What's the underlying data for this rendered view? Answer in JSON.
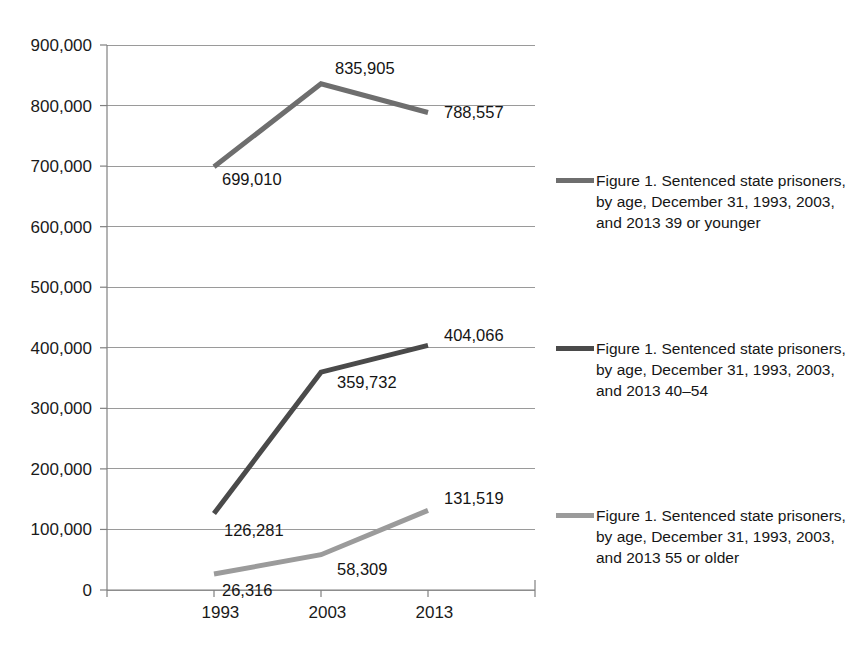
{
  "chart_data": {
    "type": "line",
    "title": "",
    "xlabel": "",
    "ylabel": "",
    "categories": [
      "1993",
      "2003",
      "2013"
    ],
    "ylim": [
      0,
      900000
    ],
    "ytick_step": 100000,
    "ytick_labels": [
      "0",
      "100,000",
      "200,000",
      "300,000",
      "400,000",
      "500,000",
      "600,000",
      "700,000",
      "800,000",
      "900,000"
    ],
    "ytick_values": [
      0,
      100000,
      200000,
      300000,
      400000,
      500000,
      600000,
      700000,
      800000,
      900000
    ],
    "grid": true,
    "legend_position": "right",
    "series": [
      {
        "name": "Figure 1. Sentenced state prisoners, by age, December 31, 1993, 2003, and 2013 39 or younger",
        "color": "#6e6e6e",
        "values": [
          699010,
          835905,
          788557
        ],
        "labels": [
          "699,010",
          "835,905",
          "788,557"
        ]
      },
      {
        "name": "Figure 1. Sentenced state prisoners, by age, December 31, 1993, 2003, and 2013 40–54",
        "color": "#4a4a4a",
        "values": [
          126281,
          359732,
          404066
        ],
        "labels": [
          "126,281",
          "359,732",
          "404,066"
        ]
      },
      {
        "name": "Figure 1. Sentenced state prisoners, by age, December 31, 1993, 2003, and 2013 55 or older",
        "color": "#9b9b9b",
        "values": [
          26316,
          58309,
          131519
        ],
        "labels": [
          "26,316",
          "58,309",
          "131,519"
        ]
      }
    ]
  },
  "axis": {
    "y_labels": [
      {
        "text": "900,000",
        "value": 900000
      },
      {
        "text": "800,000",
        "value": 800000
      },
      {
        "text": "700,000",
        "value": 700000
      },
      {
        "text": "600,000",
        "value": 600000
      },
      {
        "text": "500,000",
        "value": 500000
      },
      {
        "text": "400,000",
        "value": 400000
      },
      {
        "text": "300,000",
        "value": 300000
      },
      {
        "text": "200,000",
        "value": 200000
      },
      {
        "text": "100,000",
        "value": 100000
      },
      {
        "text": "0",
        "value": 0
      }
    ],
    "x_labels": [
      "1993",
      "2003",
      "2013"
    ]
  },
  "legend": {
    "entries": [
      {
        "label": "Figure 1. Sentenced state prisoners, by age, December 31, 1993, 2003, and 2013 39 or younger",
        "color": "#6e6e6e"
      },
      {
        "label": "Figure 1. Sentenced state prisoners, by age, December 31, 1993, 2003, and 2013 40–54",
        "color": "#4a4a4a"
      },
      {
        "label": "Figure 1. Sentenced state prisoners, by age, December 31, 1993, 2003, and 2013 55 or older",
        "color": "#9b9b9b"
      }
    ]
  },
  "point_labels": {
    "s0": [
      "699,010",
      "835,905",
      "788,557"
    ],
    "s1": [
      "126,281",
      "359,732",
      "404,066"
    ],
    "s2": [
      "26,316",
      "58,309",
      "131,519"
    ]
  }
}
